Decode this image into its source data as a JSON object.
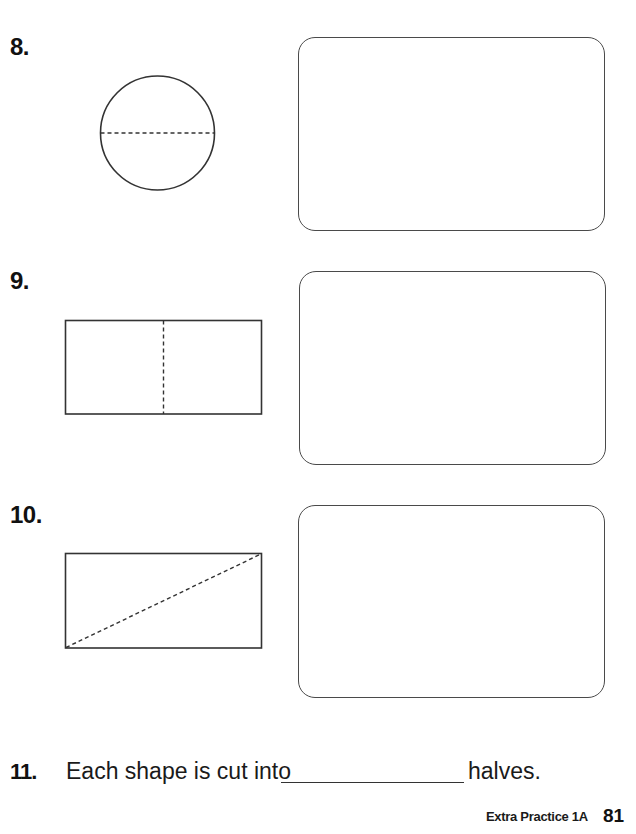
{
  "questions": [
    {
      "number": "8.",
      "shape": "circle",
      "cut": "horizontal dashed line through center",
      "answer_box": "empty"
    },
    {
      "number": "9.",
      "shape": "rectangle",
      "cut": "vertical dashed line through center",
      "answer_box": "empty"
    },
    {
      "number": "10.",
      "shape": "rectangle",
      "cut": "diagonal dashed line from bottom-left to top-right",
      "answer_box": "empty"
    }
  ],
  "statement": {
    "number": "11.",
    "text_before": "Each shape is cut into",
    "blank_value": "",
    "text_after": "halves."
  },
  "footer": {
    "label": "Extra Practice 1A",
    "page_number": "81"
  },
  "colors": {
    "line": "#333333",
    "box_border": "#4a4a4a",
    "text": "#111111"
  }
}
